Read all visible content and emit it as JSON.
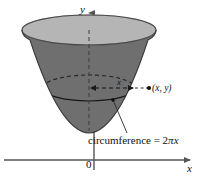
{
  "figure": {
    "name": "paraboloid-surface-of-revolution-diagram",
    "background_color": "#ffffff",
    "axes": {
      "y_axis_label": "y",
      "x_axis_label": "x",
      "origin_label": "0",
      "axis_color": "#555555"
    },
    "labels": {
      "point_label": "(x, y)",
      "radius_label": "x",
      "caption_text": "circumference = 2",
      "caption_pi": "π",
      "caption_var": "x"
    },
    "colors": {
      "outer_surface": "#6f6f6f",
      "inner_rim": "#b5b5b5",
      "outline": "#3a3a3a",
      "dash": "#2b2b2b"
    }
  }
}
